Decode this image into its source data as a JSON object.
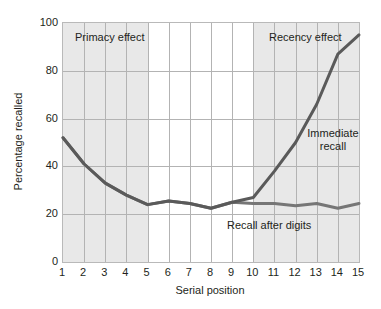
{
  "chart_data": {
    "type": "line",
    "title": "",
    "xlabel": "Serial position",
    "ylabel": "Percentage recalled",
    "x": [
      1,
      2,
      3,
      4,
      5,
      6,
      7,
      8,
      9,
      10,
      11,
      12,
      13,
      14,
      15
    ],
    "xlim": [
      1,
      15
    ],
    "ylim": [
      0,
      100
    ],
    "yticks": [
      0,
      20,
      40,
      60,
      80,
      100
    ],
    "xticks": [
      "1",
      "2",
      "3",
      "4",
      "5",
      "6",
      "7",
      "8",
      "9",
      "10",
      "11",
      "12",
      "13",
      "14",
      "15"
    ],
    "grid": true,
    "legend": "in-plot annotations",
    "series": [
      {
        "name": "Immediate recall",
        "color": "#5a5a5a",
        "values": [
          52,
          41,
          33,
          28,
          24,
          25.5,
          24.5,
          22.5,
          25,
          27,
          38,
          50,
          66,
          87,
          95
        ]
      },
      {
        "name": "Recall after digits",
        "color": "#767676",
        "values": [
          52,
          41,
          33,
          28,
          24,
          25.5,
          24.5,
          22.5,
          25,
          24.5,
          24.5,
          23.5,
          24.5,
          22.5,
          24.5
        ]
      }
    ],
    "annotations": [
      {
        "name": "primacy",
        "text": "Primacy effect",
        "x": 1.6,
        "y": 94
      },
      {
        "name": "recency",
        "text": "Recency effect",
        "x": 11.4,
        "y": 94
      },
      {
        "name": "immediate",
        "text": "Immediate recall",
        "x": 13.0,
        "y": 52
      },
      {
        "name": "digits",
        "text": "Recall after digits",
        "x": 9.5,
        "y": 14
      }
    ],
    "shaded_bands": [
      {
        "name": "primacy-band",
        "from": 1,
        "to": 5,
        "color": "#e8e8e8"
      },
      {
        "name": "recency-band",
        "from": 10,
        "to": 15,
        "color": "#e8e8e8"
      }
    ]
  },
  "axes": {
    "y_label": "Percentage recalled",
    "x_label": "Serial position",
    "y_ticks": [
      "0",
      "20",
      "40",
      "60",
      "80",
      "100"
    ],
    "x_ticks": [
      "1",
      "2",
      "3",
      "4",
      "5",
      "6",
      "7",
      "8",
      "9",
      "10",
      "11",
      "12",
      "13",
      "14",
      "15"
    ]
  },
  "annotations": {
    "primacy": "Primacy effect",
    "recency": "Recency effect",
    "immediate": "Immediate recall",
    "digits": "Recall after digits"
  },
  "colors": {
    "line": "#5a5a5a",
    "band": "#e8e8e8",
    "grid": "#b3b3b3",
    "frame": "#b9b9b9",
    "text": "#231f20"
  }
}
